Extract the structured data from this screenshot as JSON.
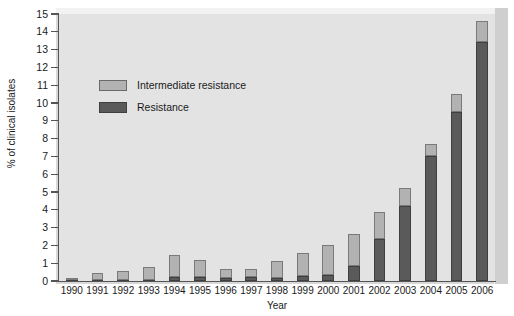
{
  "chart_data": {
    "type": "bar",
    "stacked": true,
    "title": "",
    "xlabel": "Year",
    "ylabel": "% of clinical isolates",
    "ylim": [
      0,
      15
    ],
    "ytick_step": 1,
    "yticks": [
      "0",
      "1",
      "2",
      "3",
      "4",
      "5",
      "6",
      "7",
      "8",
      "9",
      "10",
      "11",
      "12",
      "13",
      "14",
      "15"
    ],
    "grid": false,
    "legend_position": "upper-left-inside",
    "categories": [
      "1990",
      "1991",
      "1992",
      "1993",
      "1994",
      "1995",
      "1996",
      "1997",
      "1998",
      "1999",
      "2000",
      "2001",
      "2002",
      "2003",
      "2004",
      "2005",
      "2006"
    ],
    "series": [
      {
        "name": "Resistance",
        "color": "#5a5a5a",
        "values": [
          0.05,
          0.05,
          0.05,
          0.05,
          0.2,
          0.2,
          0.15,
          0.25,
          0.15,
          0.3,
          0.35,
          0.85,
          2.35,
          4.2,
          7.0,
          9.5,
          13.4
        ]
      },
      {
        "name": "Intermediate resistance",
        "color": "#b2b2b2",
        "values": [
          0.1,
          0.4,
          0.5,
          0.75,
          1.25,
          1.0,
          0.5,
          0.45,
          1.0,
          1.25,
          1.7,
          1.8,
          1.5,
          1.0,
          0.7,
          1.0,
          1.2
        ]
      }
    ],
    "totals": [
      0.15,
      0.45,
      0.55,
      0.8,
      1.45,
      1.2,
      0.65,
      0.7,
      1.15,
      1.55,
      2.05,
      2.65,
      3.85,
      5.2,
      7.7,
      10.5,
      14.6
    ]
  },
  "legend": {
    "items": [
      {
        "label": "Intermediate resistance",
        "color": "#b2b2b2"
      },
      {
        "label": "Resistance",
        "color": "#5a5a5a"
      }
    ]
  },
  "colors": {
    "plot_background": "#e3e3e3",
    "page_background": "#ffffff",
    "axis": "#555555",
    "resistance": "#5a5a5a",
    "intermediate": "#b2b2b2"
  }
}
